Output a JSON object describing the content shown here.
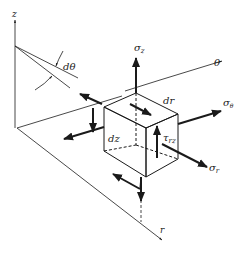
{
  "figure": {
    "labels": {
      "z_axis": "z",
      "theta_axis": "θ",
      "r_axis": "r",
      "d_theta": "dθ",
      "dr": "dr",
      "dz": "dz",
      "sigma_z": "σ",
      "sigma_z_sub": "z",
      "sigma_theta": "σ",
      "sigma_theta_sub": "θ",
      "sigma_r": "σ",
      "sigma_r_sub": "r",
      "tau_rz": "τ",
      "tau_rz_sub": "rz"
    },
    "colors": {
      "line": "#1a1a1a",
      "background": "#ffffff"
    }
  }
}
